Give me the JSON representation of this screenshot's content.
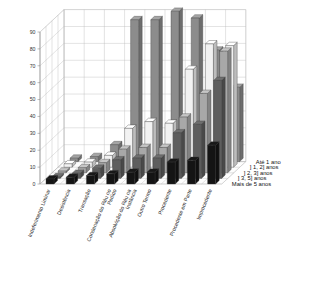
{
  "chart_data": {
    "type": "bar",
    "title": "",
    "subtitle": "",
    "xlabel": "",
    "ylabel": "",
    "zlabel": "",
    "ylim": [
      0,
      90
    ],
    "yticks": [
      0,
      10,
      20,
      30,
      40,
      50,
      60,
      70,
      80,
      90
    ],
    "grid": true,
    "projection": "3d",
    "legend_position": "right-inside",
    "categories": [
      "Indeferimento Liminar",
      "Desistência",
      "Transação",
      "Condenação do Réu no Pedido",
      "Absolvição do Réu na Instância",
      "Outro Termo",
      "Procedente",
      "Procedente em Parte",
      "Improcedente"
    ],
    "series": [
      {
        "name": "Até 1 ano",
        "color": "#8c8c8c",
        "values": [
          2,
          3,
          10,
          84,
          84,
          89,
          85,
          66,
          44
        ]
      },
      {
        "name": "] 1, 2] anos",
        "color": "#f2f2f2",
        "values": [
          2,
          3,
          7,
          23,
          27,
          26,
          58,
          73,
          72
        ]
      },
      {
        "name": "] 2, 3] anos",
        "color": "#a8a8a8",
        "values": [
          1,
          3,
          6,
          14,
          15,
          15,
          33,
          47,
          72
        ]
      },
      {
        "name": "] 3, 5] anos",
        "color": "#5e5e5e",
        "values": [
          1,
          3,
          6,
          11,
          12,
          12,
          27,
          32,
          58
        ]
      },
      {
        "name": "Mais de 5 anos",
        "color": "#141414",
        "values": [
          3,
          4,
          5,
          6,
          7,
          7,
          13,
          14,
          23
        ]
      }
    ]
  }
}
